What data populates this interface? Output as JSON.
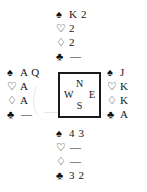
{
  "diagram": {
    "type": "bridge-hand-diagram",
    "suit_symbols": {
      "spades": "♠",
      "hearts": "♡",
      "diamonds": "♢",
      "clubs": "♣"
    },
    "void_mark": "—",
    "compass": {
      "north": "N",
      "west": "W",
      "east": "E",
      "south": "S"
    },
    "hands": {
      "north": {
        "position_label": "N",
        "spades": "K 2",
        "hearts": "2",
        "diamonds": "2",
        "clubs": "—"
      },
      "west": {
        "position_label": "W",
        "spades": "A Q",
        "hearts": "A",
        "diamonds": "A",
        "clubs": "—"
      },
      "east": {
        "position_label": "E",
        "spades": "J",
        "hearts": "K",
        "diamonds": "K",
        "clubs": "A"
      },
      "south": {
        "position_label": "S",
        "spades": "4 3",
        "hearts": "—",
        "diamonds": "—",
        "clubs": "3 2"
      }
    },
    "colors": {
      "ink": "#161616",
      "background": "#ffffff",
      "border": "#1a1a1a"
    }
  }
}
